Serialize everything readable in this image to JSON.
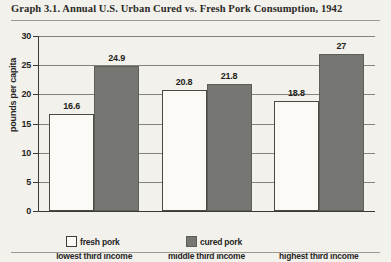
{
  "chart_data": {
    "type": "bar",
    "title": "Graph 3.1. Annual U.S. Urban Cured vs. Fresh Pork Consumption, 1942",
    "xlabel": "",
    "ylabel": "pounds per capita",
    "categories": [
      "lowest third income",
      "middle third income",
      "highest third income"
    ],
    "series": [
      {
        "name": "fresh pork",
        "color": "#fbfaf6",
        "values": [
          16.6,
          20.8,
          18.8
        ],
        "labels": [
          "16.6",
          "20.8",
          "18.8"
        ]
      },
      {
        "name": "cured pork",
        "color": "#767672",
        "values": [
          24.9,
          21.8,
          27
        ],
        "labels": [
          "24.9",
          "21.8",
          "27"
        ]
      }
    ],
    "ylim": [
      0,
      30
    ],
    "yticks": [
      0,
      5,
      10,
      15,
      20,
      25,
      30
    ],
    "ytick_labels": [
      "0",
      "5",
      "10",
      "15",
      "20",
      "25",
      "30"
    ],
    "grid": true,
    "legend_position": "bottom"
  },
  "legend": {
    "items": [
      {
        "label": "fresh pork",
        "swatch": "fresh-pork-swatch"
      },
      {
        "label": "cured pork",
        "swatch": "cured-pork-swatch"
      }
    ]
  }
}
